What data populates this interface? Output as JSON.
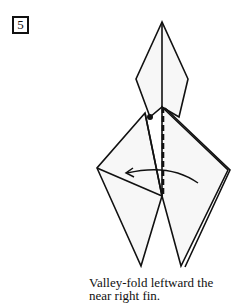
{
  "step": {
    "number": "5"
  },
  "diagram": {
    "marks": [
      "valley-fold dashed line",
      "reference dot",
      "curved fold arrow pointing left"
    ],
    "colors": {
      "paper": "#f7f7f7",
      "line": "#111111"
    }
  },
  "caption": {
    "line1": "Valley-fold leftward the",
    "line2": "near right fin."
  }
}
